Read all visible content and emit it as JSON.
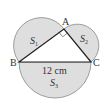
{
  "diagram": {
    "points": {
      "A": "A",
      "B": "B",
      "C": "C"
    },
    "regions": {
      "S1": "S",
      "S1_sub": "1",
      "S2": "S",
      "S2_sub": "2",
      "S3": "S",
      "S3_sub": "3"
    },
    "measurement": "12 cm",
    "colors": {
      "fill": "#dedede",
      "stroke": "#777777",
      "triangle": "#222222"
    }
  }
}
